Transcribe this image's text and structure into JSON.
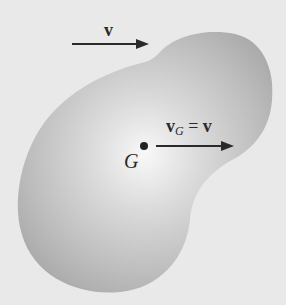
{
  "diagram": {
    "title": "",
    "body": {
      "shape": "rigid-body-blob",
      "fill_center": "#f6f6f6",
      "fill_edge": "#a9a9a9",
      "background": "#e9e9e9"
    },
    "arrows": [
      {
        "id": "v_top",
        "label": "v",
        "from": [
          72,
          44
        ],
        "to": [
          148,
          44
        ],
        "direction": "right"
      },
      {
        "id": "v_g",
        "label_main": "v",
        "label_sub": "G",
        "label_eq": " = ",
        "label_rhs": "v",
        "from": [
          156,
          146
        ],
        "to": [
          233,
          146
        ],
        "direction": "right"
      }
    ],
    "point": {
      "label": "G",
      "x": 144,
      "y": 146
    }
  },
  "labels": {
    "v_top": "v",
    "vg_main": "v",
    "vg_sub": "G",
    "vg_eq": " = ",
    "vg_rhs": "v",
    "g_point": "G"
  },
  "colors": {
    "ink": "#2a2a2a",
    "background": "#e9e9e9"
  }
}
